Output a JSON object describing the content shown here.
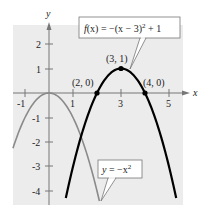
{
  "chart_data": {
    "type": "line",
    "title": "",
    "xlabel": "x",
    "ylabel": "y",
    "xlim": [
      -1.5,
      5.5
    ],
    "ylim": [
      -4.5,
      2.8
    ],
    "x_ticks": [
      -1,
      1,
      3,
      5
    ],
    "x_tick_labels": [
      "-1",
      "1",
      "3",
      "5"
    ],
    "y_ticks": [
      2,
      1,
      -1,
      -2,
      -3,
      -4
    ],
    "y_tick_labels": [
      "2",
      "1",
      "-1",
      "-2",
      "-3",
      "-4"
    ],
    "grid": false,
    "background": "#ececec",
    "series": [
      {
        "name": "y = -x^2",
        "label": "y = −x²",
        "equation": "y = -x^2",
        "color": "#8a8a8a",
        "domain": [
          -1.5,
          2.1
        ],
        "x": [
          -1.5,
          -1,
          -0.5,
          0,
          0.5,
          1,
          1.5,
          2,
          2.1
        ],
        "y": [
          -2.25,
          -1,
          -0.25,
          0,
          -0.25,
          -1,
          -2.25,
          -4,
          -4.41
        ]
      },
      {
        "name": "f(x) = -(x-3)^2 + 1",
        "label": "f(x) = −(x − 3)² + 1",
        "equation": "f(x) = -(x-3)^2 + 1",
        "color": "#000000",
        "domain": [
          0.7,
          5.3
        ],
        "x": [
          0.7,
          1,
          1.5,
          2,
          2.5,
          3,
          3.5,
          4,
          4.5,
          5,
          5.3
        ],
        "y": [
          -4.29,
          -3,
          -1.25,
          0,
          0.75,
          1,
          0.75,
          0,
          -1.25,
          -3,
          -4.29
        ]
      }
    ],
    "points": [
      {
        "x": 2,
        "y": 0,
        "label": "(2, 0)"
      },
      {
        "x": 3,
        "y": 1,
        "label": "(3, 1)"
      },
      {
        "x": 4,
        "y": 0,
        "label": "(4, 0)"
      }
    ],
    "annotations": [
      {
        "text": "f(x) = −(x − 3)² + 1",
        "target": "f(x) curve near (3.3, 0.9)"
      },
      {
        "text": "y = −x²",
        "target": "gray curve near (2.1, -4.4)"
      }
    ]
  },
  "labels": {
    "x_axis": "x",
    "y_axis": "y",
    "ticks_x": [
      "-1",
      "1",
      "3",
      "5"
    ],
    "ticks_y": [
      "2",
      "1",
      "-1",
      "-2",
      "-3",
      "-4"
    ],
    "point_2_0": "(2, 0)",
    "point_3_1": "(3, 1)",
    "point_4_0": "(4, 0)",
    "f_label_prefix": "f",
    "f_label_x": "(x)",
    "f_label_rest": " = −(x − 3)",
    "f_label_exp": "2",
    "f_label_tail": " + 1",
    "g_label_y": "y",
    "g_label_mid": " = −x",
    "g_label_exp": "2"
  }
}
